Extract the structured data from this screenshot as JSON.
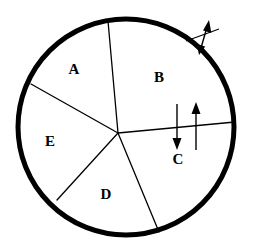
{
  "diagram": {
    "type": "sector-circle-diagram",
    "background_color": "#ffffff",
    "stroke_color": "#000000",
    "circle": {
      "center_x": 126,
      "center_y": 127,
      "radius": 108,
      "rim_stroke_width": 5
    },
    "hub": {
      "x": 118,
      "y": 133,
      "note": "common vertex where all five sector divider lines meet"
    },
    "sectors": [
      {
        "id": "A",
        "label": "A",
        "label_x": 74,
        "label_y": 71
      },
      {
        "id": "B",
        "label": "B",
        "label_x": 159,
        "label_y": 79
      },
      {
        "id": "C",
        "label": "C",
        "label_x": 178,
        "label_y": 161
      },
      {
        "id": "D",
        "label": "D",
        "label_x": 106,
        "label_y": 196
      },
      {
        "id": "E",
        "label": "E",
        "label_x": 50,
        "label_y": 143
      }
    ],
    "spokes": [
      {
        "name": "spoke-a-b",
        "from_x": 118,
        "from_y": 133,
        "to_x": 108,
        "to_y": 21
      },
      {
        "name": "spoke-a-e",
        "from_x": 118,
        "from_y": 133,
        "to_x": 31,
        "to_y": 84
      },
      {
        "name": "spoke-e-d",
        "from_x": 118,
        "from_y": 133,
        "to_x": 57,
        "to_y": 200
      },
      {
        "name": "spoke-d-c",
        "from_x": 118,
        "from_y": 133,
        "to_x": 159,
        "to_y": 232
      },
      {
        "name": "spoke-c-b",
        "from_x": 118,
        "from_y": 133,
        "to_x": 235,
        "to_y": 122
      }
    ],
    "arrows": [
      {
        "name": "down-arrow",
        "direction": "down",
        "x1": 177,
        "y1": 104,
        "x2": 177,
        "y2": 149
      },
      {
        "name": "up-arrow",
        "direction": "up",
        "x1": 196,
        "y1": 150,
        "x2": 196,
        "y2": 103
      },
      {
        "name": "double-headed-diagonal-arrow",
        "direction": "bidirectional-diagonal",
        "x1": 200,
        "y1": 52,
        "x2": 208,
        "y2": 22
      }
    ],
    "tick": {
      "name": "perpendicular-tick",
      "x1": 186,
      "y1": 40,
      "x2": 218,
      "y2": 30
    }
  }
}
